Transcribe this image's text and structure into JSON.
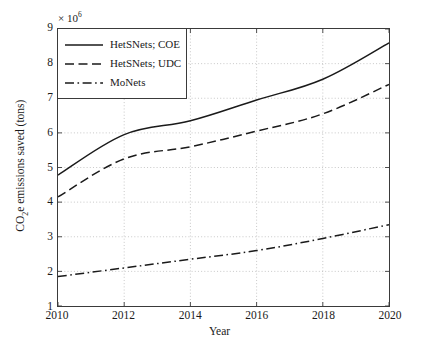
{
  "chart_data": {
    "type": "line",
    "title": "",
    "xlabel": "Year",
    "ylabel": "CO2e emissions saved (tons)",
    "ylabel_parts": {
      "pre": "CO",
      "sub": "2",
      "post": "e emissions saved (tons)"
    },
    "y_multiplier_text": "× 10",
    "y_multiplier_exponent": "6",
    "y_multiplier_value": 1000000,
    "x": [
      2010,
      2012,
      2014,
      2016,
      2018,
      2020
    ],
    "xlim": [
      2010,
      2020
    ],
    "ylim": [
      1,
      9
    ],
    "xticks": [
      2010,
      2012,
      2014,
      2016,
      2018,
      2020
    ],
    "xtick_labels": [
      "2010",
      "2012",
      "2014",
      "2016",
      "2018",
      "2020"
    ],
    "yticks": [
      1,
      2,
      3,
      4,
      5,
      6,
      7,
      8,
      9
    ],
    "ytick_labels": [
      "1",
      "2",
      "3",
      "4",
      "5",
      "6",
      "7",
      "8",
      "9"
    ],
    "grid": true,
    "grid_style": "dotted",
    "legend_position": "upper-left",
    "series": [
      {
        "name": "HetSNets; COE",
        "style": "solid",
        "color": "#1a1a1a",
        "values": [
          4.78,
          5.95,
          6.35,
          6.95,
          7.55,
          8.6
        ]
      },
      {
        "name": "HetSNets; UDC",
        "style": "dashed",
        "color": "#1a1a1a",
        "values": [
          4.15,
          5.25,
          5.6,
          6.05,
          6.55,
          7.4
        ]
      },
      {
        "name": "MoNets",
        "style": "dash-dot",
        "color": "#1a1a1a",
        "values": [
          1.85,
          2.1,
          2.35,
          2.6,
          2.95,
          3.35
        ]
      }
    ]
  },
  "legend": {
    "items": [
      {
        "label": "HetSNets; COE"
      },
      {
        "label": "HetSNets; UDC"
      },
      {
        "label": "MoNets"
      }
    ]
  }
}
